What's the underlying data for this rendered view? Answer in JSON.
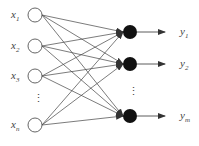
{
  "diagram": {
    "type": "single-layer neural network",
    "inputs": [
      {
        "label": "x",
        "sub": "1"
      },
      {
        "label": "x",
        "sub": "2"
      },
      {
        "label": "x",
        "sub": "3"
      },
      {
        "label": "x",
        "sub": "n"
      }
    ],
    "outputs": [
      {
        "label": "y",
        "sub": "1"
      },
      {
        "label": "y",
        "sub": "2"
      },
      {
        "label": "y",
        "sub": "m"
      }
    ],
    "ellipsis": "⋮",
    "colors": {
      "line": "#333333",
      "node_fill": "#111111",
      "input_fill": "#ffffff"
    }
  }
}
